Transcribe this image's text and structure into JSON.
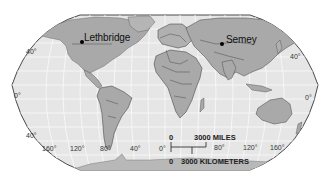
{
  "map": {
    "projection": "Robinson",
    "style": "grayscale",
    "colors": {
      "background": "#ffffff",
      "ocean": "#e6e6e6",
      "land": "#a9a9a9",
      "land_light": "#c4c4c4",
      "border": "#3a3a3a",
      "graticule": "#f7f7f7",
      "frame": "#4a4a4a",
      "marker": "#000000"
    },
    "cities": [
      {
        "name": "Lethbridge",
        "marker": "dot"
      },
      {
        "name": "Semey",
        "marker": "dot"
      }
    ],
    "latitude_labels": {
      "left": [
        "40°",
        "0°",
        "40°"
      ],
      "right": [
        "40°",
        "0°"
      ]
    },
    "longitude_labels": [
      "160°",
      "120°",
      "80°",
      "40°",
      "0°",
      "80°",
      "120°",
      "160°"
    ],
    "scale_bar": {
      "miles_zero": "0",
      "miles_label": "3000 MILES",
      "km_zero": "0",
      "km_label": "3000 KILOMETERS"
    }
  }
}
